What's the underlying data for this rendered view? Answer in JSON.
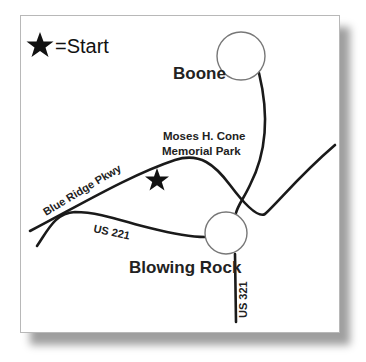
{
  "legend": {
    "symbol": "★",
    "text": "=Start"
  },
  "places": {
    "boone": "Boone",
    "blowing_rock": "Blowing Rock",
    "park_line1": "Moses H. Cone",
    "park_line2": "Memorial Park"
  },
  "roads": {
    "blue_ridge": "Blue Ridge Pkwy",
    "us221": "US 221",
    "us321": "US 321"
  },
  "colors": {
    "road": "#1a1a1a",
    "circle": "#777777",
    "shadow": "#9a9a9a"
  }
}
